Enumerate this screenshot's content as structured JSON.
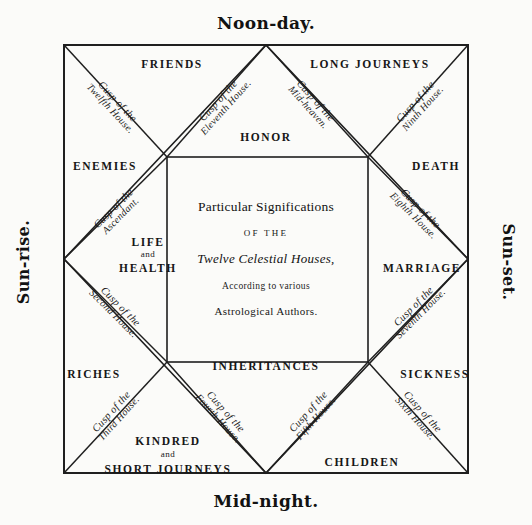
{
  "figure": {
    "title": "Particular Significations of the Twelve Celestial Houses",
    "ink_color": "#1a1a1a",
    "paper_color": "#fbfbf9"
  },
  "cardinals": {
    "top": "Noon-day.",
    "bottom": "Mid-night.",
    "left": "Sun-rise.",
    "right": "Sun-set."
  },
  "center": {
    "line1": "Particular Significations",
    "line2": "OF THE",
    "line3": "Twelve Celestial Houses,",
    "line4": "According to various",
    "line5": "Astrological Authors."
  },
  "houses": [
    {
      "name": "LIFE",
      "name_mid": "and",
      "name_2": "HEALTH",
      "cusp_line1": "Cusp of the",
      "cusp_line2": "Ascendant."
    },
    {
      "name": "RICHES",
      "cusp_line1": "Cusp of the",
      "cusp_line2": "Second House."
    },
    {
      "name": "KINDRED",
      "name_mid": "and",
      "name_2": "SHORT JOURNEYS",
      "cusp_line1": "Cusp of the",
      "cusp_line2": "Third House."
    },
    {
      "name": "INHERITANCES",
      "cusp_line1": "Cusp of the",
      "cusp_line2": "Fourth House."
    },
    {
      "name": "CHILDREN",
      "cusp_line1": "Cusp of the",
      "cusp_line2": "Fifth House."
    },
    {
      "name": "SICKNESS",
      "cusp_line1": "Cusp of the",
      "cusp_line2": "Sixth House."
    },
    {
      "name": "MARRIAGE",
      "cusp_line1": "Cusp of the",
      "cusp_line2": "Seventh House."
    },
    {
      "name": "DEATH",
      "cusp_line1": "Cusp of the",
      "cusp_line2": "Eighth House."
    },
    {
      "name": "LONG JOURNEYS",
      "cusp_line1": "Cusp of the",
      "cusp_line2": "Ninth House."
    },
    {
      "name": "HONOR",
      "cusp_line1": "Cusp of the",
      "cusp_line2": "Mid-heaven."
    },
    {
      "name": "FRIENDS",
      "cusp_line1": "Cusp of the",
      "cusp_line2": "Eleventh House."
    },
    {
      "name": "ENEMIES",
      "cusp_line1": "Cusp of the",
      "cusp_line2": "Twelfth House."
    }
  ]
}
